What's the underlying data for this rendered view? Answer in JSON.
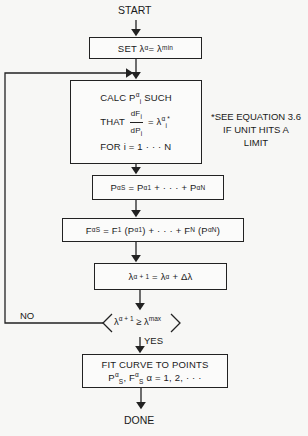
{
  "diagram": {
    "type": "flowchart",
    "start_label": "START",
    "done_label": "DONE",
    "steps": [
      {
        "id": "set",
        "text_parts": {
          "pre": "SET λ",
          "sup1": "α",
          "mid": " = λ",
          "sup2": "min"
        }
      },
      {
        "id": "calc",
        "line1_pre": "CALC P",
        "line1_sup": "α",
        "line1_sub": "i",
        "line1_post": " SUCH",
        "line2_pre": "THAT",
        "frac_num": "dF",
        "frac_num_sub": "i",
        "frac_den": "dP",
        "frac_den_sub": "i",
        "line2_post": "= λ",
        "line2_sup": "α",
        "line2_sub": "i",
        "line2_star": "*",
        "line3": "FOR i = 1 · · · N"
      },
      {
        "id": "ps",
        "formula": "P_S^α = P_1^α + · · · + P_N^α"
      },
      {
        "id": "fs",
        "formula": "F_S^α = F_1 (P_1^α) + · · · + F_N (P_N^α)"
      },
      {
        "id": "lambda_update",
        "formula": "λ^(α+1) = λ^α + Δλ"
      },
      {
        "id": "decision",
        "formula": "λ^(α+1) ≥ λ^max",
        "no_label": "NO",
        "yes_label": "YES"
      },
      {
        "id": "fit",
        "line1": "FIT CURVE TO POINTS",
        "line2": "P_S^α, F_S^α α = 1, 2, · · ·"
      }
    ],
    "note": {
      "line1": "*SEE EQUATION 3.6",
      "line2": "IF UNIT HITS A",
      "line3": "LIMIT"
    },
    "symbols": {
      "alpha": "α",
      "lambda": "λ",
      "delta": "Δ",
      "geq": "≥",
      "dots": "· · ·",
      "P": "P",
      "F": "F",
      "S": "S",
      "N": "N",
      "one": "1",
      "plus": "+",
      "eq": "=",
      "alpha_plus_1": "α + 1",
      "max": "max",
      "comma": ",",
      "alpha_list": "α = 1, 2, · · ·"
    },
    "colors": {
      "line": "#222222",
      "background": "#f7f7f5"
    }
  }
}
